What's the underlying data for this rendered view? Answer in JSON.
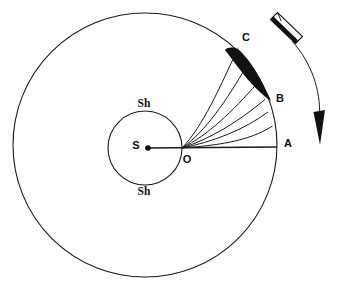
{
  "figure": {
    "background_color": "#ffffff",
    "ink_color": "#111111",
    "width": 338,
    "height": 290
  },
  "labels": {
    "center_point": "S",
    "shell_top": "Sh",
    "shell_bottom": "Sh",
    "origin_point": "O",
    "point_a": "A",
    "point_b": "B",
    "point_c": "C"
  },
  "geometry": {
    "outer_circle": {
      "cx": 145,
      "cy": 145,
      "r": 132,
      "name": "outer-orbit-circle"
    },
    "inner_circle": {
      "cx": 145,
      "cy": 148,
      "r": 37,
      "name": "inner-shell-circle"
    },
    "center_dot": {
      "cx": 145,
      "cy": 148,
      "r": 2.6
    },
    "origin": {
      "x": 182,
      "y": 148
    },
    "point_a": {
      "x": 277,
      "y": 147
    },
    "point_b": {
      "x": 265,
      "y": 99
    },
    "point_c": {
      "x": 238,
      "y": 48
    },
    "axis_line": {
      "x1": 145,
      "y1": 148,
      "x2": 277,
      "y2": 147
    }
  },
  "trajectories": {
    "count": 6,
    "description": "curved paths from O to the outer circle, fanning between A and C",
    "endpoints_deg": [
      3.5,
      12,
      19.5,
      26,
      33,
      45
    ],
    "paths": [
      "M182,148 C214,145 248,141 272,125",
      "M182,148 C212,142 243,130 268,112",
      "M182,148 C210,139 238,122 265,100",
      "M182,148 C208,135 232,112 257,83",
      "M182,148 C206,131 226,101 247,66",
      "M182,148 C203,126 219,89 238,49"
    ]
  },
  "shaded_region": {
    "name": "capture-zone",
    "fill": "#111111",
    "description": "solid black crescent between arc C-B and the uppermost trajectories"
  },
  "rotation_arrow": {
    "name": "rotation-direction-arrow",
    "description": "feathered arrow indicating direction of rotation, curving downward on the right",
    "tail_path": "M272,20 L296,42 L302,36 L278,14 Z",
    "shaft_path": "M290,35 C312,60 322,92 319,121"
  }
}
